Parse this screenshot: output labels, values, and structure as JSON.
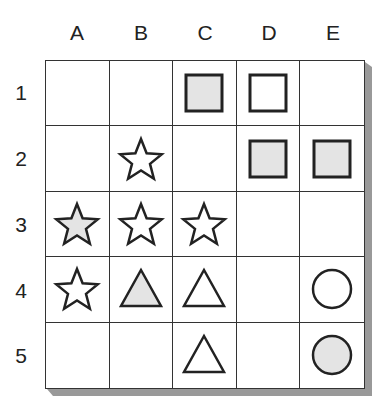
{
  "columns": [
    "A",
    "B",
    "C",
    "D",
    "E"
  ],
  "rows": [
    "1",
    "2",
    "3",
    "4",
    "5"
  ],
  "colors": {
    "fill_gray": "#e4e4e4",
    "fill_white": "#ffffff",
    "stroke": "#222222",
    "shadow": "#999999"
  },
  "cells": [
    [
      null,
      null,
      {
        "shape": "square",
        "fill": "gray"
      },
      {
        "shape": "square",
        "fill": "white"
      },
      null
    ],
    [
      null,
      {
        "shape": "star",
        "fill": "white"
      },
      null,
      {
        "shape": "square",
        "fill": "gray"
      },
      {
        "shape": "square",
        "fill": "gray"
      }
    ],
    [
      {
        "shape": "star",
        "fill": "gray"
      },
      {
        "shape": "star",
        "fill": "white"
      },
      {
        "shape": "star",
        "fill": "white"
      },
      null,
      null
    ],
    [
      {
        "shape": "star",
        "fill": "white"
      },
      {
        "shape": "triangle",
        "fill": "gray"
      },
      {
        "shape": "triangle",
        "fill": "white"
      },
      null,
      {
        "shape": "circle",
        "fill": "white"
      }
    ],
    [
      null,
      null,
      {
        "shape": "triangle",
        "fill": "white"
      },
      null,
      {
        "shape": "circle",
        "fill": "gray"
      }
    ]
  ]
}
